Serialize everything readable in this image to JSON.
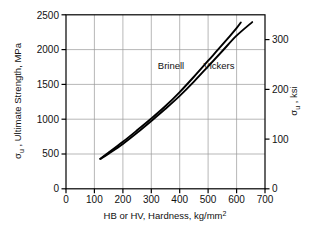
{
  "chart_data": {
    "type": "line",
    "title": "",
    "xlabel": "HB  or HV, Hardness, kg/mm",
    "xlabel_sup": "2",
    "ylabel_left_sigma": "σ",
    "ylabel_left_sub": "u",
    "ylabel_left_rest": " , Ultimate Strength, MPa",
    "ylabel_right_sigma": "σ",
    "ylabel_right_sub": "u",
    "ylabel_right_rest": " , ksi",
    "xlim": [
      0,
      700
    ],
    "ylim_left": [
      0,
      2500
    ],
    "ylim_right": [
      0,
      350
    ],
    "xticks": [
      "0",
      "100",
      "200",
      "300",
      "400",
      "500",
      "600",
      "700"
    ],
    "xtick_values": [
      0,
      100,
      200,
      300,
      400,
      500,
      600,
      700
    ],
    "yticks_left": [
      "0",
      "500",
      "1000",
      "1500",
      "2000",
      "2500"
    ],
    "ytick_values_left": [
      0,
      500,
      1000,
      1500,
      2000,
      2500
    ],
    "yticks_right": [
      "0",
      "100",
      "200",
      "300"
    ],
    "ytick_values_right": [
      0,
      100,
      200,
      300
    ],
    "grid": true,
    "legend_position": "inline-annotation",
    "series": [
      {
        "name": "Brinell",
        "label_x": 330,
        "label_y": 1760,
        "color": "#000000",
        "points": [
          [
            120,
            430
          ],
          [
            150,
            520
          ],
          [
            200,
            675
          ],
          [
            250,
            840
          ],
          [
            300,
            1010
          ],
          [
            350,
            1190
          ],
          [
            400,
            1390
          ],
          [
            450,
            1610
          ],
          [
            500,
            1840
          ],
          [
            550,
            2070
          ],
          [
            600,
            2310
          ],
          [
            615,
            2390
          ]
        ]
      },
      {
        "name": "Vickers",
        "label_x": 470,
        "label_y": 1760,
        "color": "#000000",
        "points": [
          [
            122,
            430
          ],
          [
            150,
            505
          ],
          [
            200,
            645
          ],
          [
            250,
            805
          ],
          [
            300,
            975
          ],
          [
            350,
            1150
          ],
          [
            400,
            1335
          ],
          [
            450,
            1540
          ],
          [
            500,
            1760
          ],
          [
            550,
            1980
          ],
          [
            600,
            2200
          ],
          [
            655,
            2395
          ]
        ]
      }
    ],
    "axis_color": "#000000",
    "grid_color": "#9a9a9a"
  }
}
